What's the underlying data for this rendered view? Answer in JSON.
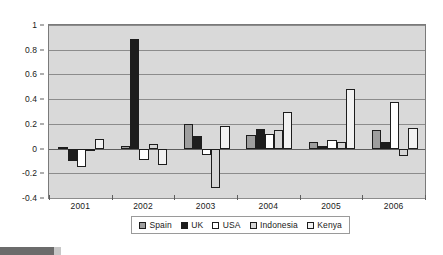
{
  "chart_data": {
    "type": "bar",
    "title": "",
    "subtitle": "",
    "xlabel": "",
    "ylabel": "",
    "categories": [
      "2001",
      "2002",
      "2003",
      "2004",
      "2005",
      "2006"
    ],
    "series": [
      {
        "name": "Spain",
        "color": "#9e9e9e",
        "values": [
          0.01,
          0.02,
          0.2,
          0.11,
          0.05,
          0.15
        ]
      },
      {
        "name": "UK",
        "color": "#1d1d1d",
        "values": [
          -0.1,
          0.89,
          0.1,
          0.16,
          0.02,
          0.05
        ]
      },
      {
        "name": "USA",
        "color": "#ffffff",
        "values": [
          -0.15,
          -0.09,
          -0.05,
          0.12,
          0.07,
          0.38
        ]
      },
      {
        "name": "Indonesia",
        "color": "#d6d6d6",
        "values": [
          -0.01,
          0.04,
          -0.32,
          0.15,
          0.05,
          -0.06
        ]
      },
      {
        "name": "Kenya",
        "color": "#f2f2f2",
        "values": [
          0.08,
          -0.13,
          0.18,
          0.3,
          0.48,
          0.17
        ]
      }
    ],
    "ylim": [
      -0.4,
      1.0
    ],
    "yticks": [
      1,
      0.8,
      0.6,
      0.4,
      0.2,
      0,
      -0.2,
      -0.4
    ],
    "ytick_labels": [
      "1",
      "0.8",
      "0.6",
      "0.4",
      "0.2",
      "0",
      "-0.2",
      "-0.4"
    ],
    "grid": true,
    "legend_position": "bottom",
    "plot_background": "#d9d9d9",
    "figure_background": "#ffffff",
    "zero_line": 0
  },
  "legend": {
    "entries": [
      {
        "label": "Spain"
      },
      {
        "label": "UK"
      },
      {
        "label": "USA"
      },
      {
        "label": "Indonesia"
      },
      {
        "label": "Kenya"
      }
    ]
  }
}
